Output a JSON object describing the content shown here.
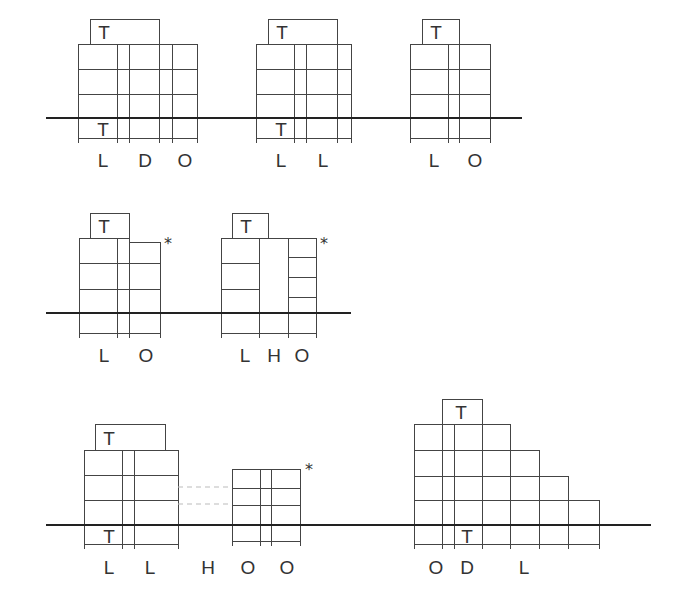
{
  "diagram": {
    "rows": [
      {
        "ground_y": 118,
        "ground_x": [
          46,
          522
        ],
        "buildings": [
          {
            "id": "b1",
            "cols_x": [
              78,
              117,
              129,
              159,
              172,
              197
            ],
            "top": 44,
            "floors": [
              44,
              69,
              94,
              118,
              138
            ],
            "bottom_tick": 143,
            "t_box": {
              "x1": 90,
              "x2": 159,
              "y1": 19,
              "y2": 44,
              "label": "T"
            },
            "t_lower": {
              "label": "T",
              "x": 103,
              "y": 136
            },
            "labels": [
              {
                "text": "L",
                "x": 103
              },
              {
                "text": "D",
                "x": 145
              },
              {
                "text": "O",
                "x": 185
              }
            ],
            "label_y": 167
          },
          {
            "id": "b2",
            "cols_x": [
              256,
              294,
              306,
              337,
              351
            ],
            "top": 44,
            "floors": [
              44,
              69,
              94,
              118,
              138
            ],
            "bottom_tick": 143,
            "t_box": {
              "x1": 268,
              "x2": 337,
              "y1": 19,
              "y2": 44,
              "label": "T"
            },
            "t_lower": {
              "label": "T",
              "x": 281,
              "y": 136
            },
            "labels": [
              {
                "text": "L",
                "x": 281
              },
              {
                "text": "L",
                "x": 323
              }
            ],
            "label_y": 167
          },
          {
            "id": "b3",
            "cols_x": [
              410,
              448,
              459,
              490
            ],
            "top": 44,
            "floors": [
              44,
              69,
              94,
              118,
              138
            ],
            "bottom_tick": 143,
            "t_box": {
              "x1": 422,
              "x2": 459,
              "y1": 19,
              "y2": 44,
              "label": "T"
            },
            "labels": [
              {
                "text": "L",
                "x": 434
              },
              {
                "text": "O",
                "x": 475
              }
            ],
            "label_y": 167
          }
        ]
      },
      {
        "ground_y": 313,
        "ground_x": [
          46,
          351
        ],
        "buildings": [
          {
            "id": "b4",
            "t_box": {
              "x1": 90,
              "x2": 129,
              "y1": 213,
              "y2": 238,
              "label": "T"
            },
            "labels": [
              {
                "text": "L",
                "x": 104
              },
              {
                "text": "O",
                "x": 146
              }
            ],
            "asterisk": {
              "text": "*",
              "x": 168,
              "y": 249
            },
            "label_y": 362
          },
          {
            "id": "b5",
            "t_box": {
              "x1": 232,
              "x2": 268,
              "y1": 213,
              "y2": 238,
              "label": "T"
            },
            "labels": [
              {
                "text": "L",
                "x": 245
              },
              {
                "text": "H",
                "x": 274
              },
              {
                "text": "O",
                "x": 302
              }
            ],
            "asterisk": {
              "text": "*",
              "x": 324,
              "y": 249
            },
            "label_y": 362
          }
        ]
      },
      {
        "ground_y": 525,
        "ground_x": [
          46,
          651
        ],
        "buildings": [
          {
            "id": "b6",
            "t_box": {
              "x1": 95,
              "x2": 165,
              "y1": 424,
              "y2": 450,
              "label": "T"
            },
            "t_lower": {
              "label": "T",
              "x": 109,
              "y": 543
            },
            "labels": [
              {
                "text": "L",
                "x": 109
              },
              {
                "text": "L",
                "x": 150
              }
            ],
            "label_y": 574
          },
          {
            "id": "b7",
            "labels": [
              {
                "text": "H",
                "x": 208
              },
              {
                "text": "O",
                "x": 248
              },
              {
                "text": "O",
                "x": 287
              }
            ],
            "asterisk": {
              "text": "*",
              "x": 309,
              "y": 475
            },
            "label_y": 574
          },
          {
            "id": "b8",
            "t_box": {
              "x1": 442,
              "x2": 482,
              "y1": 399,
              "y2": 424,
              "label": "T"
            },
            "t_lower": {
              "label": "T",
              "x": 467,
              "y": 543
            },
            "labels": [
              {
                "text": "O",
                "x": 436
              },
              {
                "text": "D",
                "x": 467
              },
              {
                "text": "L",
                "x": 524
              }
            ],
            "label_y": 574
          }
        ]
      }
    ]
  },
  "text": {
    "T": "T",
    "L": "L",
    "D": "D",
    "O": "O",
    "H": "H",
    "star": "*"
  }
}
